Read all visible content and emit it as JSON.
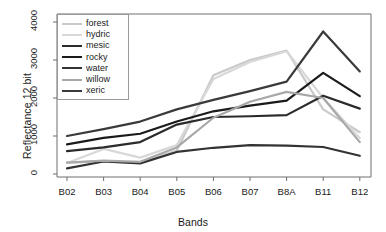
{
  "chart_data": {
    "type": "line",
    "title": "",
    "xlabel": "Bands",
    "ylabel": "Reflectance 12 bit",
    "categories": [
      "B02",
      "B03",
      "B04",
      "B05",
      "B06",
      "B07",
      "B8A",
      "B11",
      "B12"
    ],
    "xtick_labels": [
      "B02",
      "B03",
      "B04",
      "B05",
      "B06",
      "B07",
      "B8A",
      "B11",
      "B12"
    ],
    "ytick_labels": [
      "0",
      "1000",
      "2000",
      "3000",
      "4000"
    ],
    "ytick_values": [
      0,
      1000,
      2000,
      3000,
      4000
    ],
    "ylim": [
      -120,
      4180
    ],
    "xlim": [
      0,
      10
    ],
    "grid": false,
    "legend_position": "top-left",
    "series": [
      {
        "name": "forest",
        "color": "#c9c9c9",
        "width": 2.2,
        "values": [
          300,
          330,
          290,
          620,
          2600,
          3000,
          3250,
          1700,
          1100
        ]
      },
      {
        "name": "hydric",
        "color": "#d8d8d8",
        "width": 2.2,
        "values": [
          290,
          660,
          430,
          760,
          2500,
          2950,
          3230,
          2000,
          950
        ]
      },
      {
        "name": "mesic",
        "color": "#2b2b2b",
        "width": 2.2,
        "values": [
          600,
          700,
          840,
          1300,
          1500,
          1520,
          1550,
          2060,
          1720
        ]
      },
      {
        "name": "rocky",
        "color": "#1a1a1a",
        "width": 2.2,
        "values": [
          780,
          950,
          1060,
          1380,
          1650,
          1800,
          1930,
          2660,
          2050
        ]
      },
      {
        "name": "water",
        "color": "#333333",
        "width": 2.2,
        "values": [
          150,
          330,
          280,
          580,
          690,
          760,
          745,
          710,
          480
        ]
      },
      {
        "name": "willow",
        "color": "#a8a8a8",
        "width": 2.2,
        "values": [
          300,
          350,
          320,
          700,
          1480,
          1900,
          2160,
          2000,
          840
        ]
      },
      {
        "name": "xeric",
        "color": "#3a3a3a",
        "width": 2.2,
        "values": [
          1000,
          1180,
          1380,
          1700,
          1950,
          2180,
          2430,
          3750,
          2700
        ]
      }
    ]
  },
  "legend": {
    "items": [
      {
        "label": "forest"
      },
      {
        "label": "hydric"
      },
      {
        "label": "mesic"
      },
      {
        "label": "rocky"
      },
      {
        "label": "water"
      },
      {
        "label": "willow"
      },
      {
        "label": "xeric"
      }
    ]
  },
  "axes": {
    "y_title": "Reflectance 12 bit",
    "x_title": "Bands"
  },
  "style": {
    "axis_color": "#6e6e6e",
    "text_color": "#1a1a1a",
    "background": "#ffffff"
  }
}
